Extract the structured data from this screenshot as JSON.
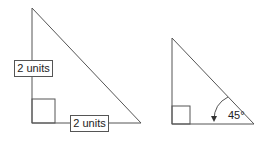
{
  "diagram": {
    "left_triangle": {
      "vertical_leg_label": "2 units",
      "horizontal_leg_label": "2 units",
      "right_angle_marker": true
    },
    "right_triangle": {
      "angle_label": "45°",
      "right_angle_marker": true
    },
    "colors": {
      "stroke": "#555555",
      "text": "#222222",
      "background": "#ffffff"
    }
  }
}
